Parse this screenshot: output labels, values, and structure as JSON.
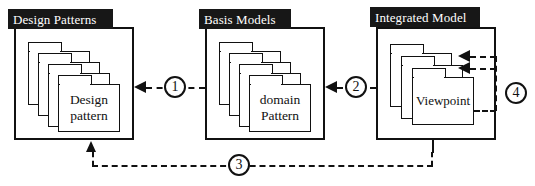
{
  "diagram": {
    "background_color": "#ffffff",
    "line_color": "#111111",
    "title_plate_bg": "#171717",
    "title_plate_fg": "#ffffff",
    "groups": [
      {
        "id": "design-patterns",
        "title": "Design Patterns",
        "card_label": "Design\npattern",
        "card_count": 4,
        "box": {
          "x": 14,
          "y": 27,
          "width": 120,
          "height": 113
        }
      },
      {
        "id": "basis-models",
        "title": "Basis Models",
        "card_label": "domain\nPattern",
        "card_count": 4,
        "box": {
          "x": 205,
          "y": 27,
          "width": 120,
          "height": 113
        }
      },
      {
        "id": "integrated-model",
        "title": "Integrated Model",
        "card_label": "Viewpoint",
        "card_count": 3,
        "box": {
          "x": 376,
          "y": 27,
          "width": 120,
          "height": 113
        }
      }
    ],
    "connectors": [
      {
        "id": "connector-1",
        "number": "①",
        "number_plain": "1",
        "from": "basis-models",
        "to": "design-patterns",
        "style": "dashed",
        "direction": "right-to-left"
      },
      {
        "id": "connector-2",
        "number": "②",
        "number_plain": "2",
        "from": "integrated-model",
        "to": "basis-models",
        "style": "dashed",
        "direction": "right-to-left"
      },
      {
        "id": "connector-3",
        "number": "③",
        "number_plain": "3",
        "from": "integrated-model",
        "to": "design-patterns",
        "style": "dashed",
        "direction": "bottom-feedback-loop"
      },
      {
        "id": "connector-4",
        "number": "④",
        "number_plain": "4",
        "from": "integrated-model",
        "to": "integrated-model",
        "style": "dashed",
        "direction": "self-loop-two-heads"
      }
    ]
  }
}
